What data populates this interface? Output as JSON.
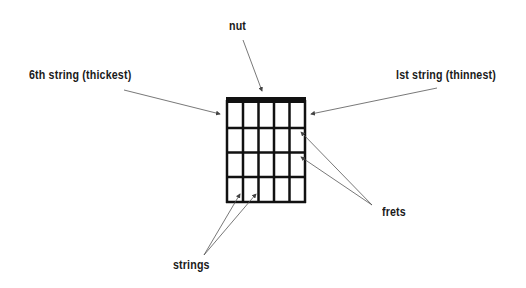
{
  "labels": {
    "nut": "nut",
    "sixth_string": "6th string (thickest)",
    "first_string": "lst string (thinnest)",
    "frets": "frets",
    "strings": "strings"
  },
  "diagram": {
    "type": "guitar-chord-grid",
    "strings": 6,
    "frets": 4,
    "colors": {
      "line": "#111111",
      "arrow": "#555555",
      "background": "#ffffff"
    }
  }
}
